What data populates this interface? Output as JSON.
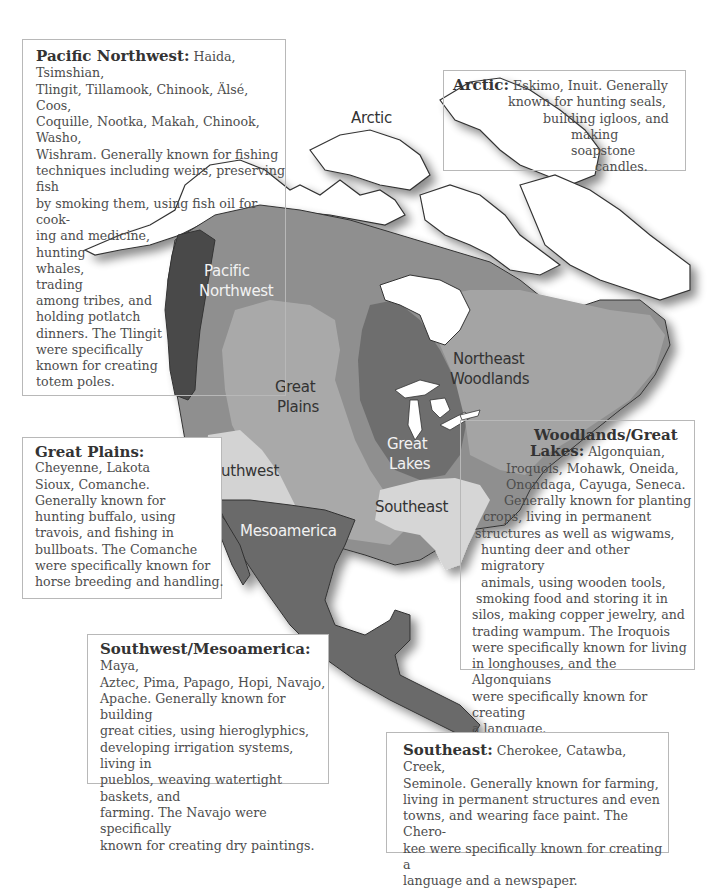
{
  "map": {
    "region_labels": {
      "arctic": "Arctic",
      "pacific_northwest_1": "Pacific",
      "pacific_northwest_2": "Northwest",
      "great_plains_1": "Great",
      "great_plains_2": "Plains",
      "great_lakes_1": "Great",
      "great_lakes_2": "Lakes",
      "northeast_woodlands_1": "Northeast",
      "northeast_woodlands_2": "Woodlands",
      "southwest": "Southwest",
      "southeast": "Southeast",
      "mesoamerica": "Mesoamerica"
    },
    "colors": {
      "pacific_northwest": "#4a4a4a",
      "subarctic": "#8f8f8f",
      "great_plains": "#a9a9a9",
      "great_lakes": "#6e6e6e",
      "northeast": "#a4a4a4",
      "southwest": "#d3d3d3",
      "southeast": "#d6d6d6",
      "mesoamerica": "#6a6a6a"
    }
  },
  "boxes": {
    "pacific_northwest": {
      "title": "Pacific Northwest:",
      "lines_top": [
        "Haida, Tsimshian,",
        "Tlingit, Tillamook, Chinook, Älsé, Coos,",
        "Coquille, Nootka, Makah, Chinook, Washo,",
        "Wishram. Generally known for fishing",
        "techniques including weirs, preserving fish",
        "by smoking them, using fish oil for cook-",
        "ing and medicine,",
        "hunting",
        "whales,",
        "trading"
      ],
      "lines_bottom": [
        "among tribes, and",
        "holding potlatch",
        "dinners. The Tlingit",
        "were specifically",
        "known for creating",
        "totem poles."
      ]
    },
    "arctic": {
      "title": "Arctic:",
      "lines": [
        "Eskimo, Inuit. Generally",
        "known for hunting seals,",
        "building igloos, and",
        "making soapstone",
        "candles."
      ]
    },
    "great_plains": {
      "title": "Great Plains:",
      "lines": [
        "Cheyenne, Lakota",
        "Sioux, Comanche.",
        "Generally known for",
        "hunting buffalo, using",
        "travois, and fishing in",
        "bullboats. The Comanche",
        "were specifically known for",
        "horse breeding and handling."
      ]
    },
    "woodlands": {
      "title_1": "Woodlands/Great",
      "title_2": "Lakes:",
      "lines": [
        "Algonquian,",
        "Iroquois, Mohawk, Oneida,",
        "Onondaga, Cayuga, Seneca.",
        "Generally known for planting",
        "crops, living in permanent",
        "structures as well as wigwams,",
        "hunting deer and other migratory",
        "animals, using wooden tools,",
        "smoking food and storing it in",
        "silos, making copper jewelry, and",
        "trading wampum. The Iroquois",
        "were specifically known for living",
        "in longhouses, and the Algonquians",
        "were specifically known for creating",
        "a language."
      ]
    },
    "southwest_mesoamerica": {
      "title": "Southwest/Mesoamerica:",
      "lines": [
        "Maya,",
        "Aztec, Pima, Papago, Hopi, Navajo,",
        "Apache. Generally known for building",
        "great cities, using hieroglyphics,",
        "developing irrigation systems, living in",
        "pueblos, weaving watertight baskets, and",
        "farming. The Navajo were specifically",
        "known for creating dry paintings."
      ]
    },
    "southeast": {
      "title": "Southeast:",
      "lines": [
        "Cherokee, Catawba, Creek,",
        "Seminole. Generally known for farming,",
        "living in permanent structures and even",
        "towns, and wearing face paint. The Chero-",
        "kee were specifically known for creating a",
        "language and a newspaper."
      ]
    }
  }
}
